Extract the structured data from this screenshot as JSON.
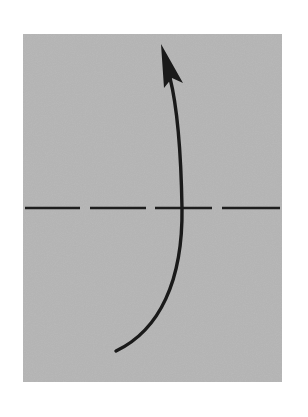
{
  "diagram": {
    "type": "origami-fold-instruction",
    "paper": {
      "x": 23,
      "y": 34,
      "width": 259,
      "height": 348,
      "fill": "#b5b5b5"
    },
    "fold_line": {
      "style": "dashed",
      "y": 208,
      "x_start": 25,
      "x_end": 280,
      "color": "#1e1e1e",
      "dashes": [
        [
          25,
          80
        ],
        [
          90,
          146
        ],
        [
          155,
          212
        ],
        [
          222,
          280
        ]
      ]
    },
    "arrow": {
      "direction": "up",
      "color": "#1a1a1a",
      "start": [
        116,
        351
      ],
      "end": [
        163,
        55
      ]
    }
  }
}
